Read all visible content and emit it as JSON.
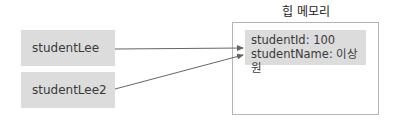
{
  "diagram": {
    "references": [
      {
        "label": "studentLee"
      },
      {
        "label": "studentLee2"
      }
    ],
    "heap": {
      "title": "힙 메모리",
      "object": {
        "fields": [
          {
            "text": "studentId: 100"
          },
          {
            "text": "studentName: 이상원"
          }
        ]
      }
    },
    "edges": [
      {
        "from": "studentLee",
        "to": "heap.object"
      },
      {
        "from": "studentLee2",
        "to": "heap.object"
      }
    ],
    "colors": {
      "box_fill": "#dcdcdc",
      "line": "#666666",
      "heap_border": "#b5b5b5"
    }
  }
}
